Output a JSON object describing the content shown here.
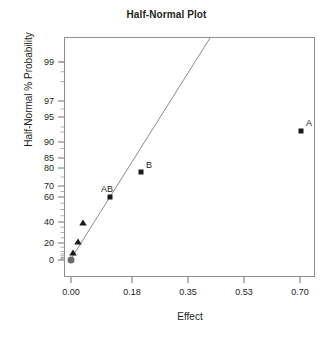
{
  "chart_data": {
    "type": "scatter",
    "title": "Half-Normal Plot",
    "xlabel": "Effect",
    "ylabel": "Half-Normal % Probability",
    "xlim": [
      -0.0465,
      0.8385
    ],
    "ylim": [
      0,
      99.9
    ],
    "grid": false,
    "legend": null,
    "xticks": [
      {
        "value": 0.0,
        "label": "0.00",
        "px": 71
      },
      {
        "value": 0.18,
        "label": "0.18",
        "px": 132
      },
      {
        "value": 0.35,
        "label": "0.35",
        "px": 188
      },
      {
        "value": 0.53,
        "label": "0.53",
        "px": 244
      },
      {
        "value": 0.7,
        "label": "0.70",
        "px": 300
      }
    ],
    "yticks": [
      {
        "value": 99,
        "label": "99",
        "px": 62
      },
      {
        "value": 97,
        "label": "97",
        "px": 101
      },
      {
        "value": 95,
        "label": "95",
        "px": 117
      },
      {
        "value": 90,
        "label": "90",
        "px": 142
      },
      {
        "value": 85,
        "label": "85",
        "px": 158
      },
      {
        "value": 80,
        "label": "80",
        "px": 168
      },
      {
        "value": 70,
        "label": "70",
        "px": 186
      },
      {
        "value": 60,
        "label": "60",
        "px": 197
      },
      {
        "value": 40,
        "label": "40",
        "px": 222
      },
      {
        "value": 20,
        "label": "20",
        "px": 243
      },
      {
        "value": 0,
        "label": "0",
        "px": 260
      }
    ],
    "yminor_ticks": [
      1,
      2,
      3,
      5,
      7,
      10,
      15,
      25,
      30,
      35,
      45,
      50,
      55,
      65,
      75,
      88,
      92,
      93,
      96,
      98,
      98.5,
      99.2,
      99.5
    ],
    "reference_line": {
      "color": "#6e6e6e",
      "width": 0.8,
      "x1_px": 69,
      "y1_px": 262,
      "x2_px": 210,
      "y2_px": 38
    },
    "points": [
      {
        "label": "",
        "effect": 0.0,
        "probability": 0.5,
        "marker": "circle",
        "px": 71,
        "py": 260,
        "color": "#6b6b6b",
        "size": 6
      },
      {
        "label": "",
        "effect": 0.004,
        "probability": 5,
        "marker": "triangle",
        "px": 73,
        "py": 253,
        "color": "#1a1a1a",
        "size": 6
      },
      {
        "label": "",
        "effect": 0.015,
        "probability": 21,
        "marker": "triangle",
        "px": 78,
        "py": 242,
        "color": "#1a1a1a",
        "size": 6
      },
      {
        "label": "",
        "effect": 0.03,
        "probability": 40,
        "marker": "triangle",
        "px": 83,
        "py": 223,
        "color": "#1a1a1a",
        "size": 6
      },
      {
        "label": "AB",
        "effect": 0.092,
        "probability": 59,
        "marker": "square",
        "px": 110,
        "py": 197,
        "color": "#1a1a1a",
        "size": 5
      },
      {
        "label": "B",
        "effect": 0.196,
        "probability": 74,
        "marker": "square",
        "px": 141,
        "py": 172,
        "color": "#1a1a1a",
        "size": 5
      },
      {
        "label": "A",
        "effect": 0.702,
        "probability": 91,
        "marker": "square",
        "px": 301,
        "py": 131,
        "color": "#1a1a1a",
        "size": 5
      }
    ],
    "point_labels": [
      {
        "text": "AB",
        "px": 101,
        "py": 185
      },
      {
        "text": "B",
        "px": 146,
        "py": 161
      },
      {
        "text": "A",
        "px": 306,
        "py": 119
      }
    ]
  },
  "caption": ""
}
